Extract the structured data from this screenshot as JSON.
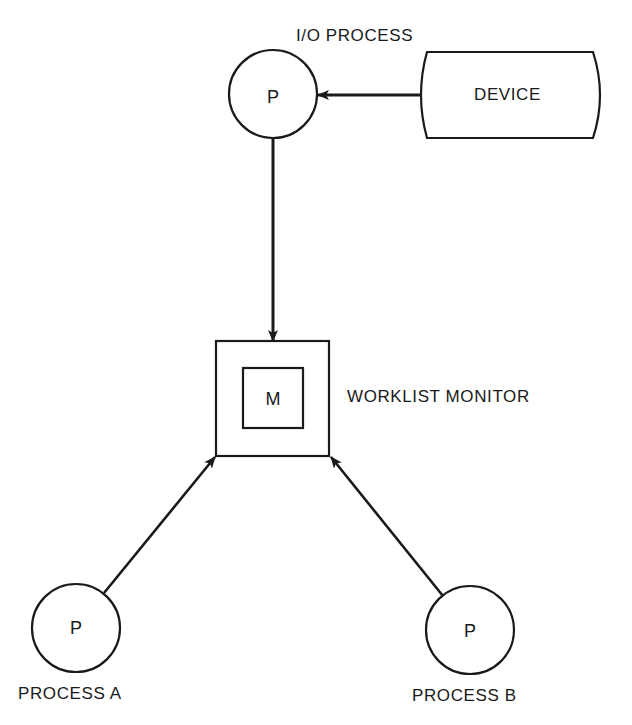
{
  "diagram": {
    "type": "process-monitor-diagram",
    "stroke_color": "#1a1a1a",
    "background": "#ffffff",
    "nodes": {
      "io_process": {
        "letter": "P",
        "label": "I/O PROCESS",
        "shape": "circle"
      },
      "device": {
        "label": "DEVICE",
        "shape": "storage"
      },
      "monitor": {
        "letter": "M",
        "label": "WORKLIST MONITOR",
        "shape": "nested-square"
      },
      "process_a": {
        "letter": "P",
        "label": "PROCESS A",
        "shape": "circle"
      },
      "process_b": {
        "letter": "P",
        "label": "PROCESS B",
        "shape": "circle"
      }
    },
    "edges": [
      {
        "from": "DEVICE",
        "to": "I/O PROCESS"
      },
      {
        "from": "I/O PROCESS",
        "to": "WORKLIST MONITOR"
      },
      {
        "from": "PROCESS A",
        "to": "WORKLIST MONITOR"
      },
      {
        "from": "PROCESS B",
        "to": "WORKLIST MONITOR"
      }
    ]
  }
}
